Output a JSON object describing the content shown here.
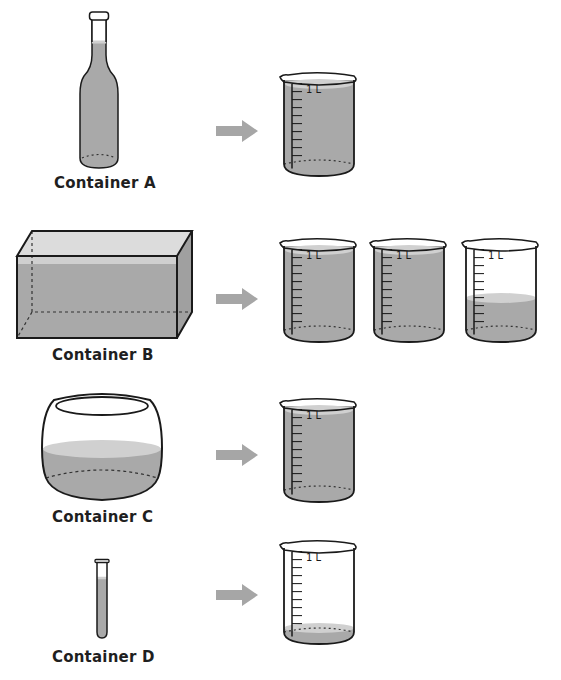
{
  "colors": {
    "liquid": "#a9a9a9",
    "liquid_surface": "#d9d9d9",
    "outline": "#1a1a1a",
    "arrow": "#a6a6a6",
    "background": "#ffffff"
  },
  "beaker": {
    "scale_label": "1 L",
    "tick_count": 10
  },
  "rows": [
    {
      "container_label": "Container A",
      "container_shape": "bottle",
      "arrow_icon": "right-arrow-icon",
      "beakers": [
        {
          "fill_fraction": 1.0
        }
      ]
    },
    {
      "container_label": "Container B",
      "container_shape": "rectangular-tank",
      "arrow_icon": "right-arrow-icon",
      "beakers": [
        {
          "fill_fraction": 1.0
        },
        {
          "fill_fraction": 1.0
        },
        {
          "fill_fraction": 0.4
        }
      ]
    },
    {
      "container_label": "Container C",
      "container_shape": "round-bowl",
      "arrow_icon": "right-arrow-icon",
      "beakers": [
        {
          "fill_fraction": 1.0
        }
      ]
    },
    {
      "container_label": "Container D",
      "container_shape": "test-tube",
      "arrow_icon": "right-arrow-icon",
      "beakers": [
        {
          "fill_fraction": 0.05
        }
      ]
    }
  ]
}
